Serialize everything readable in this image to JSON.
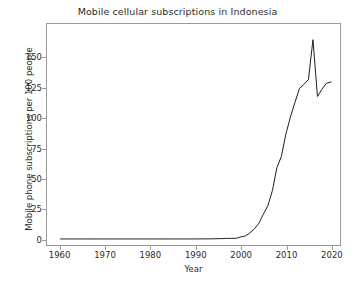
{
  "chart_data": {
    "type": "line",
    "title": "Mobile cellular subscriptions in Indonesia",
    "xlabel": "Year",
    "ylabel": "Mobile phone subscriptions per 100 people",
    "xlim": [
      1957,
      2022
    ],
    "ylim": [
      -5,
      178
    ],
    "grid": false,
    "legend": null,
    "xticks": [
      1960,
      1970,
      1980,
      1990,
      2000,
      2010,
      2020
    ],
    "yticks": [
      0,
      25,
      50,
      75,
      100,
      125,
      150
    ],
    "series": [
      {
        "name": "Mobile cellular subscriptions per 100 people",
        "color": "#1f1f1f",
        "x": [
          1960,
          1961,
          1962,
          1963,
          1964,
          1965,
          1966,
          1967,
          1968,
          1969,
          1970,
          1971,
          1972,
          1973,
          1974,
          1975,
          1976,
          1977,
          1978,
          1979,
          1980,
          1981,
          1982,
          1983,
          1984,
          1985,
          1986,
          1987,
          1988,
          1989,
          1990,
          1991,
          1992,
          1993,
          1994,
          1995,
          1996,
          1997,
          1998,
          1999,
          2000,
          2001,
          2002,
          2003,
          2004,
          2005,
          2006,
          2007,
          2008,
          2009,
          2010,
          2011,
          2012,
          2013,
          2014,
          2015,
          2016,
          2017,
          2018,
          2019,
          2020
        ],
        "values": [
          0,
          0,
          0,
          0,
          0,
          0,
          0,
          0,
          0,
          0,
          0,
          0,
          0,
          0,
          0,
          0,
          0,
          0,
          0,
          0,
          0,
          0,
          0,
          0,
          0,
          0,
          0,
          0,
          0,
          0.01,
          0.03,
          0.05,
          0.07,
          0.1,
          0.14,
          0.2,
          0.35,
          0.5,
          0.5,
          0.55,
          1.7,
          2.5,
          5.0,
          8.3,
          13.0,
          20.5,
          27.5,
          40.0,
          59.0,
          68.5,
          87.0,
          101.0,
          113.0,
          124.5,
          128.0,
          132.0,
          165.0,
          118.0,
          124.0,
          129.0,
          130.0
        ]
      }
    ],
    "annotations": []
  }
}
